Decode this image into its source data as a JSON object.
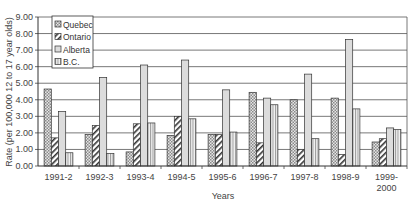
{
  "chart_data": {
    "type": "bar",
    "title": "",
    "xlabel": "Years",
    "ylabel": "Rate (per 100,000 12 to 17 year olds)",
    "ylim": [
      0,
      9
    ],
    "yticks": [
      "0.00",
      "1.00",
      "2.00",
      "3.00",
      "4.00",
      "5.00",
      "6.00",
      "7.00",
      "8.00",
      "9.00"
    ],
    "grid": true,
    "legend_position": "top-left",
    "categories": [
      "1991-2",
      "1992-3",
      "1993-4",
      "1994-5",
      "1995-6",
      "1996-7",
      "1997-8",
      "1998-9",
      "1999-\n2000"
    ],
    "series": [
      {
        "name": "Quebec",
        "pattern": "checker",
        "values": [
          4.65,
          1.9,
          0.85,
          1.85,
          1.9,
          4.45,
          4.0,
          4.1,
          1.45
        ]
      },
      {
        "name": "Ontario",
        "pattern": "diagonal",
        "values": [
          1.7,
          2.45,
          2.55,
          3.0,
          1.9,
          1.4,
          1.0,
          0.7,
          1.65
        ]
      },
      {
        "name": "Alberta",
        "pattern": "light",
        "values": [
          3.3,
          5.35,
          6.1,
          6.4,
          4.6,
          4.1,
          5.55,
          7.65,
          2.3
        ]
      },
      {
        "name": "B.C.",
        "pattern": "vertical",
        "values": [
          0.8,
          0.75,
          2.6,
          2.85,
          2.05,
          3.7,
          1.65,
          3.45,
          2.2
        ]
      }
    ]
  }
}
